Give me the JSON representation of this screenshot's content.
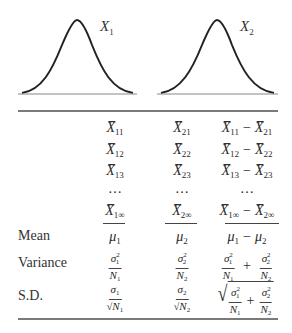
{
  "distributions": [
    {
      "label": "X",
      "subscript": "1"
    },
    {
      "label": "X",
      "subscript": "2"
    }
  ],
  "table": {
    "sample_rows": [
      {
        "col1_sub": "11",
        "col2_sub": "21",
        "col3_a_sub": "11",
        "col3_b_sub": "21"
      },
      {
        "col1_sub": "12",
        "col2_sub": "22",
        "col3_a_sub": "12",
        "col3_b_sub": "22"
      },
      {
        "col1_sub": "13",
        "col2_sub": "23",
        "col3_a_sub": "13",
        "col3_b_sub": "23"
      },
      {
        "ellipsis": "…"
      },
      {
        "col1_sub": "1∞",
        "col2_sub": "2∞",
        "col3_a_sub": "1∞",
        "col3_b_sub": "2∞"
      }
    ],
    "symbol_x": "X",
    "minus": "−",
    "plus": "+",
    "summary_rows": [
      {
        "label": "Mean",
        "col1": {
          "sym": "μ",
          "sub": "1"
        },
        "col2": {
          "sym": "μ",
          "sub": "2"
        },
        "col3": {
          "a": "μ",
          "a_sub": "1",
          "b": "μ",
          "b_sub": "2"
        }
      },
      {
        "label": "Variance",
        "col1": {
          "num": "σ",
          "num_sup": "2",
          "num_sub": "1",
          "den": "N",
          "den_sub": "1"
        },
        "col2": {
          "num": "σ",
          "num_sup": "2",
          "num_sub": "2",
          "den": "N",
          "den_sub": "2"
        }
      },
      {
        "label": "S.D.",
        "col1": {
          "num": "σ",
          "num_sub": "1",
          "den_root": "√",
          "den": "N",
          "den_sub": "1"
        },
        "col2": {
          "num": "σ",
          "num_sub": "2",
          "den_root": "√",
          "den": "N",
          "den_sub": "2"
        },
        "col3_root": "√"
      }
    ]
  }
}
